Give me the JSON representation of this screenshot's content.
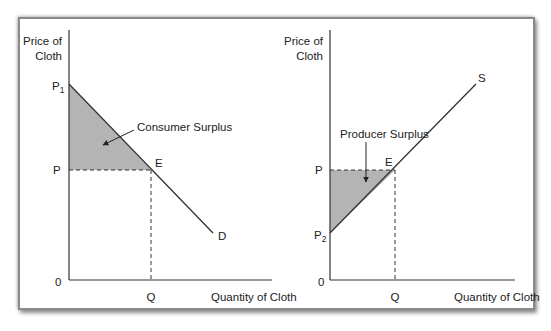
{
  "consumer_panel": {
    "y_axis_label_line1": "Price of",
    "y_axis_label_line2": "Cloth",
    "x_axis_label": "Quantity of Cloth",
    "origin": "0",
    "price_high": "P",
    "price_high_sub": "1",
    "price_eq": "P",
    "quantity_eq": "Q",
    "equilibrium": "E",
    "curve_label": "D",
    "area_label": "Consumer Surplus"
  },
  "producer_panel": {
    "y_axis_label_line1": "Price of",
    "y_axis_label_line2": "Cloth",
    "x_axis_label": "Quantity of Cloth",
    "origin": "0",
    "price_eq": "P",
    "price_low": "P",
    "price_low_sub": "2",
    "quantity_eq": "Q",
    "equilibrium": "E",
    "curve_label": "S",
    "area_label": "Producer Surplus"
  },
  "colors": {
    "surplus_fill": "#b4b4b4",
    "line": "#333333"
  }
}
